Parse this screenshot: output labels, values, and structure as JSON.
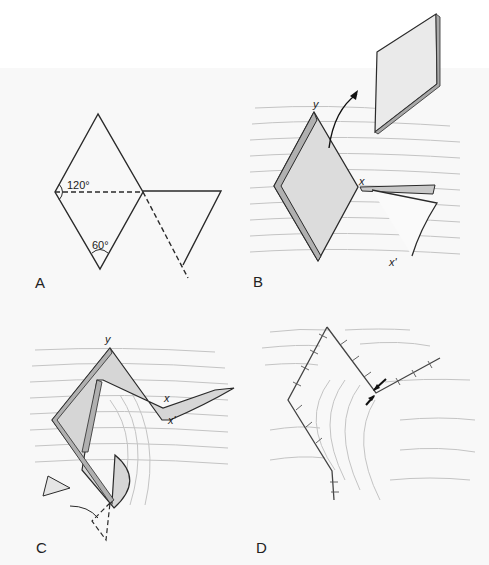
{
  "figure": {
    "panels": [
      {
        "id": "A",
        "label": "A",
        "angle_labels": [
          "120°",
          "60°"
        ]
      },
      {
        "id": "B",
        "label": "B",
        "point_labels": [
          "y",
          "x",
          "x'"
        ]
      },
      {
        "id": "C",
        "label": "C",
        "point_labels": [
          "y",
          "x",
          "x'"
        ]
      },
      {
        "id": "D",
        "label": "D"
      }
    ]
  },
  "colors": {
    "line": "#2a2a2a",
    "flap_fill": "#d9d9d9",
    "skin_lines": "#b8b8b8",
    "background": "#f8f8f8"
  }
}
